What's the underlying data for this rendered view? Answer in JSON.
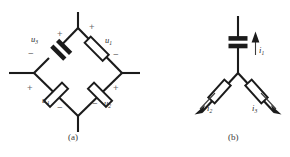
{
  "figure": {
    "captions": [
      {
        "id": "caption-a",
        "text": "(a)",
        "x": 68,
        "y": 133
      },
      {
        "id": "caption-b",
        "text": "(b)",
        "x": 212,
        "y": 133
      }
    ],
    "colors": {
      "wire": "#1b1b1b",
      "sign": "#6a6a6a",
      "label": "#2a2a2a",
      "background": "#ffffff"
    },
    "panel_a": {
      "name": "bridge-diamond-circuit",
      "nodes": {
        "top": {
          "x": 78,
          "y": 28
        },
        "left": {
          "x": 34,
          "y": 73
        },
        "right": {
          "x": 122,
          "y": 73
        },
        "bottom": {
          "x": 78,
          "y": 116
        }
      },
      "terminals": [
        {
          "name": "terminal-top",
          "x": 78,
          "y": 12
        },
        {
          "name": "terminal-left",
          "x": 9,
          "y": 73
        },
        {
          "name": "terminal-right",
          "x": 140,
          "y": 73
        },
        {
          "name": "terminal-bottom",
          "x": 78,
          "y": 132
        }
      ],
      "elements": [
        {
          "id": "capacitor-u3",
          "type": "capacitor",
          "branch": "top-left",
          "label": "u",
          "subscript": "3",
          "label_x": 31,
          "label_y": 35,
          "plus": {
            "x": 57,
            "y": 29
          },
          "minus": {
            "x": 28,
            "y": 51
          }
        },
        {
          "id": "resistor-u1",
          "type": "resistor",
          "branch": "top-right",
          "label": "u",
          "subscript": "1",
          "label_x": 105,
          "label_y": 36,
          "plus": {
            "x": 89,
            "y": 22
          },
          "minus": {
            "x": 113,
            "y": 52
          }
        },
        {
          "id": "resistor-u4",
          "type": "resistor",
          "branch": "bottom-left",
          "label": "u",
          "subscript": "4",
          "label_x": 42,
          "label_y": 96,
          "plus": {
            "x": 27,
            "y": 83
          },
          "minus": {
            "x": 57,
            "y": 104
          }
        },
        {
          "id": "resistor-u2",
          "type": "resistor",
          "branch": "bottom-right",
          "label": "u",
          "subscript": "2",
          "label_x": 104,
          "label_y": 99,
          "plus": {
            "x": 113,
            "y": 83
          },
          "minus": {
            "x": 93,
            "y": 100
          }
        }
      ]
    },
    "panel_b": {
      "name": "three-branch-star-circuit",
      "nodes": {
        "center": {
          "x": 238,
          "y": 73
        }
      },
      "terminals": [
        {
          "name": "terminal-top",
          "x": 238,
          "y": 16
        },
        {
          "name": "terminal-lower-left",
          "x": 202,
          "y": 112
        },
        {
          "name": "terminal-lower-right",
          "x": 274,
          "y": 112
        }
      ],
      "elements": [
        {
          "id": "capacitor-b",
          "type": "capacitor",
          "branch": "vertical",
          "label": null,
          "subscript": null
        },
        {
          "id": "resistor-left-b",
          "type": "resistor",
          "branch": "lower-left"
        },
        {
          "id": "resistor-right-b",
          "type": "resistor",
          "branch": "lower-right"
        }
      ],
      "currents": [
        {
          "id": "current-i1",
          "label": "i",
          "subscript": "1",
          "label_x": 257,
          "label_y": 47,
          "direction": "up"
        },
        {
          "id": "current-i2",
          "label": "i",
          "subscript": "2",
          "label_x": 204,
          "label_y": 107,
          "direction": "down-left"
        },
        {
          "id": "current-i3",
          "label": "i",
          "subscript": "3",
          "label_x": 252,
          "label_y": 107,
          "direction": "down-right"
        }
      ]
    }
  }
}
